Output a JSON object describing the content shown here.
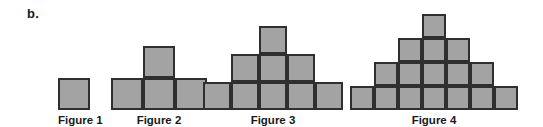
{
  "part_label": "b.",
  "colors": {
    "cell_fill": "#a3a3a3",
    "cell_border": "#2f2f2f",
    "text": "#1a1a1a",
    "background": "#ffffff"
  },
  "figures": [
    {
      "caption": "Figure 1",
      "rows": [
        1
      ],
      "total_squares": 1,
      "cell_size": 32,
      "left": 58,
      "width": 32
    },
    {
      "caption": "Figure 2",
      "rows": [
        3,
        1
      ],
      "total_squares": 4,
      "cell_size": 32,
      "left": 111,
      "width": 96
    },
    {
      "caption": "Figure 3",
      "rows": [
        5,
        3,
        1
      ],
      "total_squares": 9,
      "cell_size": 28,
      "left": 203,
      "width": 140
    },
    {
      "caption": "Figure 4",
      "rows": [
        7,
        5,
        3,
        1
      ],
      "total_squares": 16,
      "cell_size": 24,
      "left": 350,
      "width": 168
    }
  ]
}
